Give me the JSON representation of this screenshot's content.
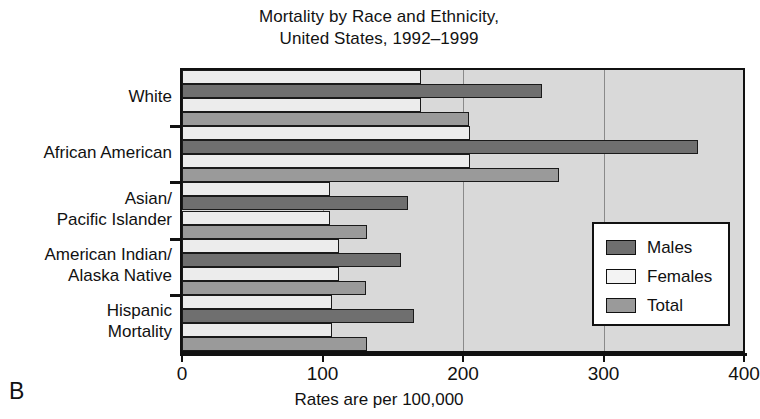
{
  "chart_data": {
    "type": "bar",
    "orientation": "horizontal",
    "title": "Mortality by Race and Ethnicity,\nUnited States, 1992–1999",
    "title_line1": "Mortality by Race and Ethnicity,",
    "title_line2": "United States, 1992–1999",
    "xlabel": "Rates are per 100,000",
    "ylabel": "",
    "xlim": [
      0,
      400
    ],
    "xticks": [
      0,
      100,
      200,
      300,
      400
    ],
    "xticklabels": [
      "0",
      "100",
      "200",
      "300",
      "400"
    ],
    "grid": true,
    "grid_axis": "x",
    "legend_position": "lower right",
    "panel_letter": "B",
    "categories": [
      "White",
      "African American",
      "Asian/\nPacific Islander",
      "American Indian/\nAlaska Native",
      "Hispanic\nMortality"
    ],
    "category_lines": [
      [
        "White"
      ],
      [
        "African American"
      ],
      [
        "Asian/",
        "Pacific Islander"
      ],
      [
        "American Indian/",
        "Alaska Native"
      ],
      [
        "Hispanic",
        "Mortality"
      ]
    ],
    "series": [
      {
        "name": "Females",
        "color": "#ececec",
        "values": [
          170,
          205,
          105,
          112,
          107
        ]
      },
      {
        "name": "Males",
        "color": "#6f6f6f",
        "values": [
          256,
          367,
          161,
          156,
          165
        ]
      },
      {
        "name": "Total",
        "color": "#9a9a9a",
        "values": [
          204,
          268,
          132,
          131,
          132
        ]
      }
    ],
    "bar_order_top_to_bottom": [
      "Females",
      "Males",
      "Females",
      "Total"
    ],
    "note": "Each category group renders four stacked rows: a light (Females) row, a dark (Males) row, a light (Females) row, and a medium-gray (Total) row, matching the printed figure."
  },
  "legend": {
    "items": [
      {
        "label": "Males",
        "swatch": "males"
      },
      {
        "label": "Females",
        "swatch": "females"
      },
      {
        "label": "Total",
        "swatch": "total"
      }
    ]
  },
  "colors": {
    "plot_background": "#d9d9d9",
    "males": "#6f6f6f",
    "females": "#ececec",
    "total": "#9a9a9a",
    "axis": "#111111",
    "gridline": "#8a8a8a"
  }
}
